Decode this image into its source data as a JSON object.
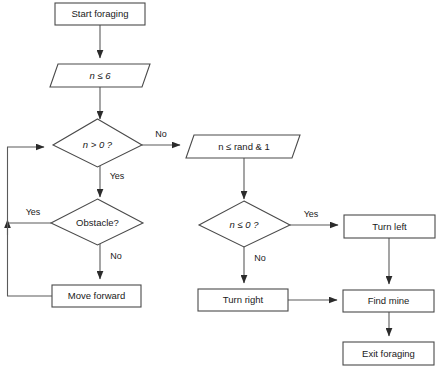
{
  "diagram": {
    "colors": {
      "background": "#ffffff",
      "stroke": "#4a4a4a",
      "line": "#5a5a5a",
      "text": "#1a1a1a"
    },
    "nodes": [
      {
        "id": "start_foraging",
        "label": "Start foraging",
        "shape": "process",
        "italic": false
      },
      {
        "id": "n_le_6",
        "label": "n ≤ 6",
        "shape": "parallelogram",
        "italic": true
      },
      {
        "id": "n_gt_0",
        "label": "n > 0 ?",
        "shape": "decision",
        "italic": true
      },
      {
        "id": "n_le_rand",
        "label": "n ≤ rand & 1",
        "shape": "parallelogram",
        "italic": false
      },
      {
        "id": "obstacle",
        "label": "Obstacle?",
        "shape": "decision",
        "italic": false
      },
      {
        "id": "n_le_0",
        "label": "n ≤ 0 ?",
        "shape": "decision",
        "italic": true
      },
      {
        "id": "turn_left",
        "label": "Turn left",
        "shape": "process",
        "italic": false
      },
      {
        "id": "move_forward",
        "label": "Move forward",
        "shape": "process",
        "italic": false
      },
      {
        "id": "turn_right",
        "label": "Turn right",
        "shape": "process",
        "italic": false
      },
      {
        "id": "find_mine",
        "label": "Find mine",
        "shape": "process",
        "italic": false
      },
      {
        "id": "exit_foraging",
        "label": "Exit foraging",
        "shape": "process",
        "italic": false
      }
    ],
    "edge_labels": {
      "n_gt_0_no": "No",
      "n_gt_0_yes": "Yes",
      "obstacle_yes": "Yes",
      "obstacle_no": "No",
      "n_le_0_yes": "Yes",
      "n_le_0_no": "No"
    }
  }
}
